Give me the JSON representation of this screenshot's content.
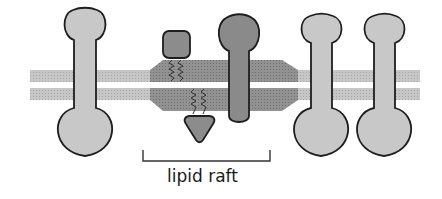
{
  "diagram": {
    "label": "lipid raft",
    "colors": {
      "membrane": "#c4c4c4",
      "raft_membrane": "#8f8f8f",
      "protein_light": "#c8c8c8",
      "protein_dark": "#8a8a8a",
      "outline": "#1e1e1e",
      "bracket": "#333333"
    },
    "elements": [
      {
        "id": "membrane-bilayer",
        "desc": "two parallel membrane leaflets"
      },
      {
        "id": "lipid-raft-region",
        "desc": "thickened darker region of the bilayer"
      },
      {
        "id": "transmembrane-protein-left",
        "desc": "dumbbell-shaped protein spanning membrane"
      },
      {
        "id": "gpi-anchored-protein",
        "desc": "square protein anchored to outer leaflet by lipid tails"
      },
      {
        "id": "raft-transmembrane-protein",
        "desc": "dark protein inserted in raft"
      },
      {
        "id": "lipid-anchored-protein",
        "desc": "triangular protein anchored to inner leaflet by lipid tails"
      },
      {
        "id": "transmembrane-protein-right-1",
        "desc": "dumbbell-shaped protein spanning membrane"
      },
      {
        "id": "transmembrane-protein-right-2",
        "desc": "dumbbell-shaped protein spanning membrane"
      },
      {
        "id": "raft-bracket",
        "desc": "bracket indicating raft extent"
      }
    ]
  }
}
